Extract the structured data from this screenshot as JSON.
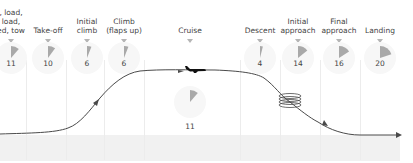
{
  "diagram": {
    "wedge_color": "#a9a9a9",
    "line_color": "#4a4a4a",
    "phases": [
      {
        "label": "Taxi, load,\nunload,\nparked, tow",
        "visible_label": ", load,\nload,\ned, tow",
        "value": "11",
        "pct": 11
      },
      {
        "label": "Take-off",
        "value": "10",
        "pct": 10
      },
      {
        "label": "Initial\nclimb",
        "value": "6",
        "pct": 6
      },
      {
        "label": "Climb\n(flaps up)",
        "value": "6",
        "pct": 6
      },
      {
        "label": "Cruise",
        "value": "11",
        "pct": 11
      },
      {
        "label": "Descent",
        "value": "4",
        "pct": 4
      },
      {
        "label": "Initial\napproach",
        "value": "14",
        "pct": 14
      },
      {
        "label": "Final\napproach",
        "value": "16",
        "pct": 16
      },
      {
        "label": "Landing",
        "value": "20",
        "pct": 20
      }
    ]
  }
}
